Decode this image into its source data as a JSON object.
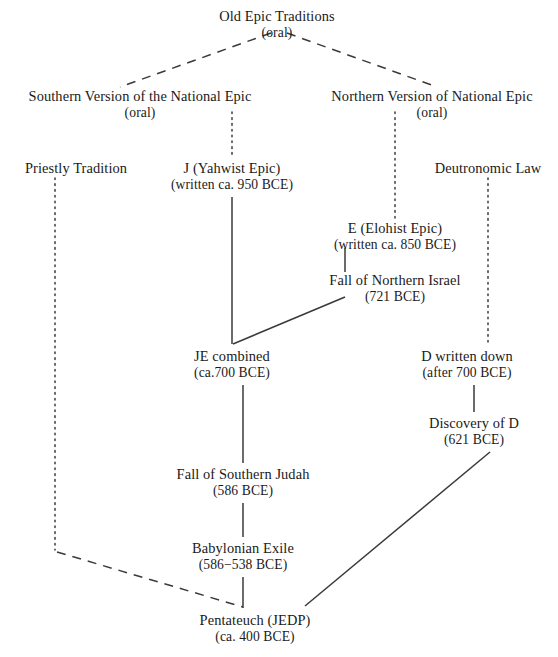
{
  "diagram": {
    "colors": {
      "background": "#ffffff",
      "text": "#1a1a1a",
      "line": "#3a3a3a"
    },
    "nodes": [
      {
        "id": "old-epic-traditions",
        "line1": "Old Epic Traditions",
        "line2": "(oral)",
        "x": 277,
        "y": 8
      },
      {
        "id": "southern-version",
        "line1": "Southern Version of the National Epic",
        "line2": "(oral)",
        "x": 140,
        "y": 88
      },
      {
        "id": "northern-version",
        "line1": "Northern Version of National Epic",
        "line2": "(oral)",
        "x": 432,
        "y": 88
      },
      {
        "id": "priestly-tradition",
        "line1": "Priestly Tradition",
        "line2": "",
        "x": 76,
        "y": 160
      },
      {
        "id": "j-yahwist-epic",
        "line1": "J (Yahwist Epic)",
        "line2": "(written ca. 950 BCE)",
        "x": 232,
        "y": 160
      },
      {
        "id": "deutronomic-law",
        "line1": "Deutronomic Law",
        "line2": "",
        "x": 488,
        "y": 160
      },
      {
        "id": "e-elohist-epic",
        "line1": "E (Elohist Epic)",
        "line2": "(written ca. 850 BCE)",
        "x": 395,
        "y": 220
      },
      {
        "id": "fall-northern-israel",
        "line1": "Fall of Northern Israel",
        "line2": "(721 BCE)",
        "x": 395,
        "y": 272
      },
      {
        "id": "je-combined",
        "line1": "JE combined",
        "line2": "(ca.700 BCE)",
        "x": 232,
        "y": 348
      },
      {
        "id": "d-written-down",
        "line1": "D written down",
        "line2": "(after 700 BCE)",
        "x": 467,
        "y": 348
      },
      {
        "id": "discovery-of-d",
        "line1": "Discovery of D",
        "line2": "(621 BCE)",
        "x": 474,
        "y": 415
      },
      {
        "id": "fall-southern-judah",
        "line1": "Fall of Southern Judah",
        "line2": "(586 BCE)",
        "x": 243,
        "y": 466
      },
      {
        "id": "babylonian-exile",
        "line1": "Babylonian Exile",
        "line2": "(586−538 BCE)",
        "x": 243,
        "y": 540
      },
      {
        "id": "pentateuch-jedp",
        "line1": "Pentateuch (JEDP)",
        "line2": "(ca. 400 BCE)",
        "x": 255,
        "y": 612
      }
    ],
    "edges": [
      {
        "id": "edge-old-epic-to-southern",
        "from": "old-epic-traditions",
        "to": "southern-version",
        "style": "dashed",
        "x1": 271,
        "y1": 33,
        "x2": 120,
        "y2": 87
      },
      {
        "id": "edge-old-epic-to-northern",
        "from": "old-epic-traditions",
        "to": "northern-version",
        "style": "dashed",
        "x1": 287,
        "y1": 33,
        "x2": 437,
        "y2": 87
      },
      {
        "id": "edge-southern-to-j",
        "from": "southern-version",
        "to": "j-yahwist-epic",
        "style": "dotted",
        "x1": 232,
        "y1": 112,
        "x2": 232,
        "y2": 158
      },
      {
        "id": "edge-northern-to-e",
        "from": "northern-version",
        "to": "e-elohist-epic",
        "style": "dotted",
        "x1": 395,
        "y1": 112,
        "x2": 395,
        "y2": 218
      },
      {
        "id": "edge-priestly-to-pentateuch-v",
        "from": "priestly-tradition",
        "to": "pentateuch-jedp",
        "style": "dotted",
        "x1": 55,
        "y1": 178,
        "x2": 55,
        "y2": 550
      },
      {
        "id": "edge-priestly-to-pentateuch-d",
        "from": "priestly-tradition",
        "to": "pentateuch-jedp",
        "style": "dashed",
        "x1": 57,
        "y1": 552,
        "x2": 243,
        "y2": 607
      },
      {
        "id": "edge-deutronomic-to-d-written",
        "from": "deutronomic-law",
        "to": "d-written-down",
        "style": "dotted",
        "x1": 488,
        "y1": 178,
        "x2": 488,
        "y2": 345
      },
      {
        "id": "edge-e-to-fall-northern",
        "from": "e-elohist-epic",
        "to": "fall-northern-israel",
        "style": "solid",
        "x1": 345,
        "y1": 248,
        "x2": 345,
        "y2": 272
      },
      {
        "id": "edge-fall-northern-to-je",
        "from": "fall-northern-israel",
        "to": "je-combined",
        "style": "solid",
        "x1": 345,
        "y1": 297,
        "x2": 233,
        "y2": 344
      },
      {
        "id": "edge-j-to-je",
        "from": "j-yahwist-epic",
        "to": "je-combined",
        "style": "solid",
        "x1": 232,
        "y1": 197,
        "x2": 232,
        "y2": 344
      },
      {
        "id": "edge-je-to-fall-southern",
        "from": "je-combined",
        "to": "fall-southern-judah",
        "style": "solid",
        "x1": 243,
        "y1": 385,
        "x2": 243,
        "y2": 463
      },
      {
        "id": "edge-d-written-to-discovery",
        "from": "d-written-down",
        "to": "discovery-of-d",
        "style": "solid",
        "x1": 474,
        "y1": 385,
        "x2": 474,
        "y2": 412
      },
      {
        "id": "edge-discovery-to-pentateuch",
        "from": "discovery-of-d",
        "to": "pentateuch-jedp",
        "style": "solid",
        "x1": 490,
        "y1": 452,
        "x2": 305,
        "y2": 606
      },
      {
        "id": "edge-fall-southern-to-exile",
        "from": "fall-southern-judah",
        "to": "babylonian-exile",
        "style": "solid",
        "x1": 243,
        "y1": 503,
        "x2": 243,
        "y2": 537
      },
      {
        "id": "edge-exile-to-pentateuch",
        "from": "babylonian-exile",
        "to": "pentateuch-jedp",
        "style": "solid",
        "x1": 243,
        "y1": 577,
        "x2": 243,
        "y2": 608
      }
    ]
  }
}
